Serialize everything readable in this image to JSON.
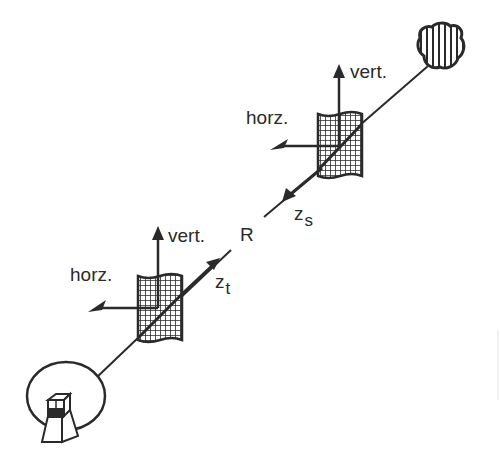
{
  "diagram": {
    "title": "",
    "colors": {
      "ink": "#2a2a2a",
      "background": "#ffffff"
    },
    "range_label": "R",
    "transmitter_side": {
      "vertical_label": "vert.",
      "horizontal_label": "horz.",
      "axis_label_main": "z",
      "axis_label_sub": "t"
    },
    "scatterer_side": {
      "vertical_label": "vert.",
      "horizontal_label": "horz.",
      "axis_label_main": "z",
      "axis_label_sub": "s"
    },
    "elements": {
      "antenna": "radar-dish-icon",
      "target": "scatterer-cloud-icon",
      "screens": [
        "transmitter-polarization-screen",
        "scatterer-polarization-screen"
      ]
    }
  }
}
